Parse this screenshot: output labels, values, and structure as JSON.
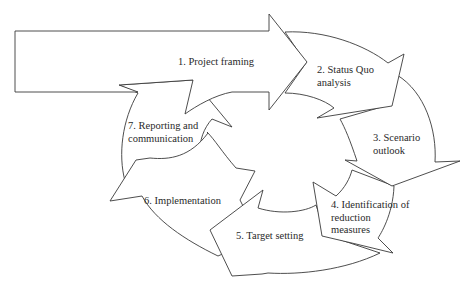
{
  "diagram": {
    "type": "cycle",
    "stroke_color": "#3a3a3a",
    "fill_color": "#ffffff",
    "steps": [
      {
        "id": 1,
        "label": "1. Project framing"
      },
      {
        "id": 2,
        "label": "2. Status Quo\nanalysis"
      },
      {
        "id": 3,
        "label": "3. Scenario\noutlook"
      },
      {
        "id": 4,
        "label": "4. Identification of\nreduction\nmeasures"
      },
      {
        "id": 5,
        "label": "5. Target setting"
      },
      {
        "id": 6,
        "label": "6. Implementation"
      },
      {
        "id": 7,
        "label": "7. Reporting and\ncommunication"
      }
    ]
  }
}
